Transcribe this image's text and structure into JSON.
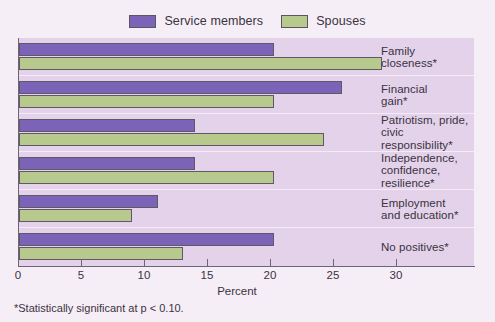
{
  "chart_data": {
    "type": "bar",
    "orientation": "horizontal",
    "title": "",
    "xlabel": "Percent",
    "ylabel": "",
    "xlim": [
      0,
      31.5
    ],
    "xticks": [
      0,
      5,
      10,
      15,
      20,
      25,
      30
    ],
    "grid": false,
    "legend_position": "top-center",
    "categories": [
      "Family\ncloseness*",
      "Financial\ngain*",
      "Patriotism, pride,\ncivic responsibility*",
      "Independence,\nconfidence,\nresilience*",
      "Employment\nand education*",
      "No positives*"
    ],
    "series": [
      {
        "name": "Service members",
        "color": "#7b63b8",
        "values": [
          20.2,
          25.6,
          14.0,
          14.0,
          11.0,
          20.2
        ]
      },
      {
        "name": "Spouses",
        "color": "#b7c98c",
        "values": [
          28.8,
          20.2,
          24.2,
          20.2,
          9.0,
          13.0
        ]
      }
    ],
    "footnote": "*Statistically significant at p < 0.10."
  },
  "legend": {
    "items": [
      {
        "label": "Service members",
        "color": "#7b63b8"
      },
      {
        "label": "Spouses",
        "color": "#b7c98c"
      }
    ]
  },
  "axis": {
    "tick_labels": [
      "0",
      "5",
      "10",
      "15",
      "20",
      "25",
      "30"
    ],
    "title": "Percent"
  },
  "footnote": "*Statistically significant at p < 0.10."
}
